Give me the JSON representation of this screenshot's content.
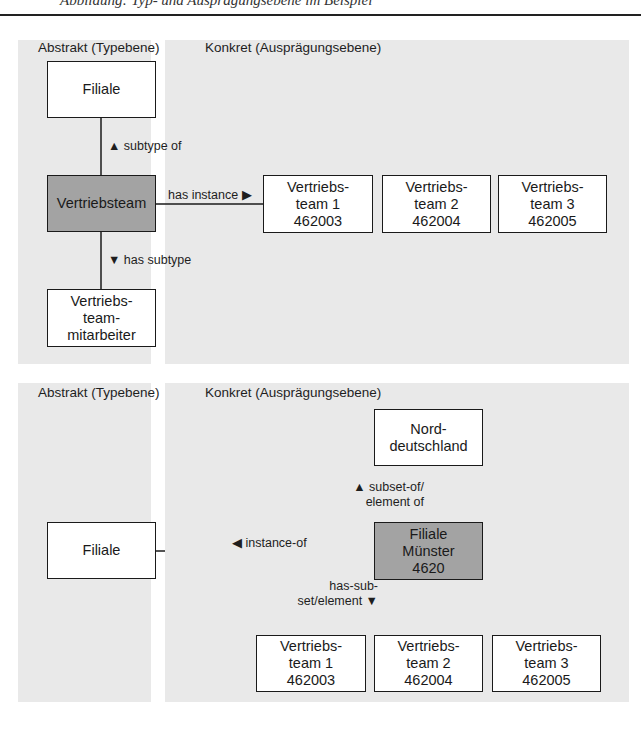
{
  "header": {
    "cut_text": "Abbildung: Typ- und Ausprägungsebene im Beispiel"
  },
  "diagram1": {
    "abstract_title": "Abstrakt (Typebene)",
    "concrete_title": "Konkret (Ausprägungsebene)",
    "nodes": {
      "filiale": "Filiale",
      "vertriebsteam": "Vertriebsteam",
      "mitarbeiter": "Vertriebs-\nteam-\nmitarbeiter",
      "team1": "Vertriebs-\nteam 1\n462003",
      "team2": "Vertriebs-\nteam 2\n462004",
      "team3": "Vertriebs-\nteam 3\n462005"
    },
    "edges": {
      "subtype_of": "▲ subtype of",
      "has_instance": "has instance ▶",
      "has_subtype": "▼ has subtype"
    }
  },
  "diagram2": {
    "abstract_title": "Abstrakt (Typebene)",
    "concrete_title": "Konkret (Ausprägungsebene)",
    "nodes": {
      "filiale": "Filiale",
      "norddeutschland": "Nord-\ndeutschland",
      "muenster": "Filiale\nMünster\n4620",
      "team1": "Vertriebs-\nteam 1\n462003",
      "team2": "Vertriebs-\nteam 2\n462004",
      "team3": "Vertriebs-\nteam 3\n462005"
    },
    "edges": {
      "subset_of": "▲ subset-of/\nelement of",
      "instance_of": "◀ instance-of",
      "has_subset": "has-sub-\nset/element ▼"
    }
  },
  "colors": {
    "panel_bg": "#e9e9e9",
    "type_node_bg": "#a3a3a3",
    "node_bg": "#ffffff",
    "line": "#1a1a1a"
  }
}
